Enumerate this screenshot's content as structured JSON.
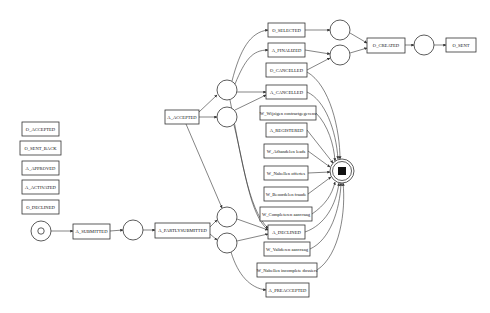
{
  "diagram": {
    "type": "petri-net",
    "colors": {
      "stroke": "#333333",
      "fill": "#ffffff",
      "text": "#111111"
    },
    "isolated_transitions": [
      {
        "id": "t_o_accepted",
        "label": "O_ACCEPTED",
        "x": 22,
        "y": 122,
        "w": 37,
        "h": 14
      },
      {
        "id": "t_o_sent_back",
        "label": "O_SENT_BACK",
        "x": 20,
        "y": 141,
        "w": 41,
        "h": 14
      },
      {
        "id": "t_a_approved",
        "label": "A_APPROVED",
        "x": 22,
        "y": 161,
        "w": 37,
        "h": 14
      },
      {
        "id": "t_a_activated",
        "label": "A_ACTIVATED",
        "x": 22,
        "y": 180,
        "w": 37,
        "h": 14
      },
      {
        "id": "t_o_declined",
        "label": "O_DECLINED",
        "x": 22,
        "y": 200,
        "w": 37,
        "h": 14
      }
    ],
    "transitions": [
      {
        "id": "t_a_submitted",
        "label": "A_SUBMITTED",
        "x": 73,
        "y": 224,
        "w": 37,
        "h": 15
      },
      {
        "id": "t_a_partlysubmitted",
        "label": "A_PARTLYSUBMITTED",
        "x": 155,
        "y": 223,
        "w": 55,
        "h": 15
      },
      {
        "id": "t_a_accepted",
        "label": "A_ACCEPTED",
        "x": 165,
        "y": 110,
        "w": 34,
        "h": 14
      },
      {
        "id": "t_o_selected",
        "label": "O_SELECTED",
        "x": 268,
        "y": 23,
        "w": 37,
        "h": 14
      },
      {
        "id": "t_a_finalized",
        "label": "A_FINALIZED",
        "x": 268,
        "y": 43,
        "w": 37,
        "h": 14
      },
      {
        "id": "t_o_cancelled",
        "label": "O_CANCELLED",
        "x": 266,
        "y": 63,
        "w": 41,
        "h": 14
      },
      {
        "id": "t_a_cancelled",
        "label": "A_CANCELLED",
        "x": 266,
        "y": 85,
        "w": 41,
        "h": 14
      },
      {
        "id": "t_w_wijzigen",
        "label": "W_Wijzigen contractgegevens",
        "x": 260,
        "y": 106,
        "w": 56,
        "h": 14
      },
      {
        "id": "t_a_registered",
        "label": "A_REGISTERED",
        "x": 266,
        "y": 123,
        "w": 41,
        "h": 14
      },
      {
        "id": "t_w_afhandelen",
        "label": "W_Afhandelen leads",
        "x": 264,
        "y": 144,
        "w": 44,
        "h": 14
      },
      {
        "id": "t_w_nabellen_off",
        "label": "W_Nabellen offertes",
        "x": 264,
        "y": 166,
        "w": 44,
        "h": 14
      },
      {
        "id": "t_w_beoordelen",
        "label": "W_Beoordelen fraude",
        "x": 264,
        "y": 187,
        "w": 44,
        "h": 14
      },
      {
        "id": "t_w_completeren",
        "label": "W_Completeren aanvraag",
        "x": 260,
        "y": 207,
        "w": 52,
        "h": 14
      },
      {
        "id": "t_a_declined",
        "label": "A_DECLINED",
        "x": 268,
        "y": 225,
        "w": 37,
        "h": 14
      },
      {
        "id": "t_w_valideren",
        "label": "W_Valideren aanvraag",
        "x": 264,
        "y": 242,
        "w": 46,
        "h": 14
      },
      {
        "id": "t_w_nabellen_inc",
        "label": "W_Nabellen incomplete dossiers",
        "x": 257,
        "y": 263,
        "w": 60,
        "h": 14
      },
      {
        "id": "t_a_preaccepted",
        "label": "A_PREACCEPTED",
        "x": 266,
        "y": 283,
        "w": 43,
        "h": 14
      },
      {
        "id": "t_o_created",
        "label": "O_CREATED",
        "x": 367,
        "y": 38,
        "w": 38,
        "h": 15
      },
      {
        "id": "t_o_sent",
        "label": "O_SENT",
        "x": 446,
        "y": 38,
        "w": 30,
        "h": 14
      }
    ],
    "places": [
      {
        "id": "p_start",
        "cx": 41,
        "cy": 231,
        "r": 10,
        "kind": "start"
      },
      {
        "id": "p1",
        "cx": 133,
        "cy": 230,
        "r": 10,
        "kind": "plain"
      },
      {
        "id": "p_acc_a",
        "cx": 227,
        "cy": 90,
        "r": 10,
        "kind": "plain"
      },
      {
        "id": "p_acc_b",
        "cx": 227,
        "cy": 117,
        "r": 10,
        "kind": "plain"
      },
      {
        "id": "p_ps_a",
        "cx": 227,
        "cy": 217,
        "r": 10,
        "kind": "plain"
      },
      {
        "id": "p_ps_b",
        "cx": 227,
        "cy": 243,
        "r": 10,
        "kind": "plain"
      },
      {
        "id": "p_sel",
        "cx": 340,
        "cy": 30,
        "r": 10,
        "kind": "plain"
      },
      {
        "id": "p_fin",
        "cx": 340,
        "cy": 55,
        "r": 10,
        "kind": "plain"
      },
      {
        "id": "p_created",
        "cx": 424,
        "cy": 45,
        "r": 10,
        "kind": "plain"
      },
      {
        "id": "p_end",
        "cx": 342,
        "cy": 171,
        "r": 12,
        "kind": "end"
      }
    ]
  }
}
